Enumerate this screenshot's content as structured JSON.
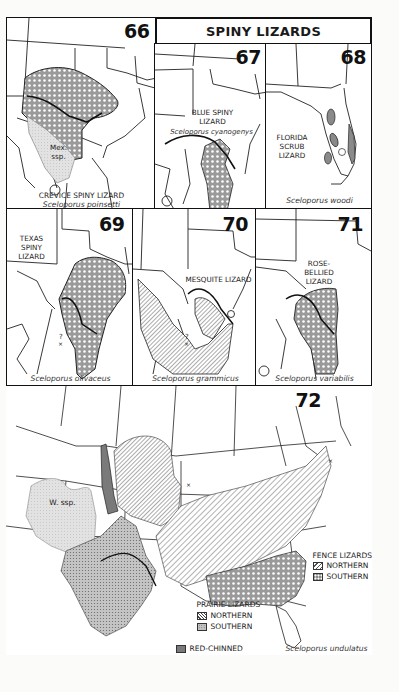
{
  "page": {
    "title": "SPINY LIZARDS"
  },
  "colors": {
    "border": "#111111",
    "crosshatch_fill": "#8a8a8a",
    "light_stipple": "#d6d6d6",
    "red_chinned": "#7a7a7a",
    "background": "#ffffff"
  },
  "maps": [
    {
      "number": "66",
      "common_name": "CREVICE SPINY LIZARD",
      "scientific_name": "Sceloporus poinsetti",
      "annotation": "Mex. ssp."
    },
    {
      "number": "67",
      "common_name": "BLUE SPINY LIZARD",
      "scientific_name": "Sceloporus cyanogenys"
    },
    {
      "number": "68",
      "common_name": "FLORIDA SCRUB LIZARD",
      "scientific_name": "Sceloporus woodi"
    },
    {
      "number": "69",
      "common_name": "TEXAS SPINY LIZARD",
      "scientific_name": "Sceloporus olivaceus",
      "annotation": "?"
    },
    {
      "number": "70",
      "common_name": "MESQUITE LIZARD",
      "scientific_name": "Sceloporus grammicus",
      "annotation": "?"
    },
    {
      "number": "71",
      "common_name": "ROSE-BELLIED LIZARD",
      "scientific_name": "Sceloporus variabilis"
    },
    {
      "number": "72",
      "scientific_name": "Sceloporus undulatus",
      "annotation": "W. ssp."
    }
  ],
  "legend_72": {
    "fence": {
      "title": "FENCE LIZARDS",
      "items": [
        {
          "label": "NORTHERN",
          "pattern": "sparse-diagonal"
        },
        {
          "label": "SOUTHERN",
          "pattern": "crosshatch"
        }
      ]
    },
    "prairie": {
      "title": "PRAIRIE LIZARDS",
      "items": [
        {
          "label": "NORTHERN",
          "pattern": "dense-diagonal"
        },
        {
          "label": "SOUTHERN",
          "pattern": "dots"
        }
      ]
    },
    "red_chinned": {
      "label": "RED-CHINNED",
      "pattern": "solid-gray"
    }
  }
}
